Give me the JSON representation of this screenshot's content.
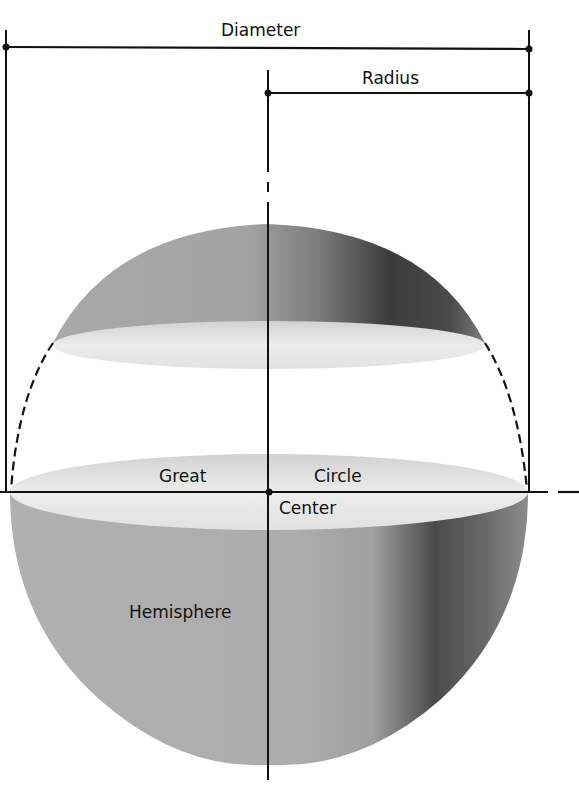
{
  "diagram": {
    "labels": {
      "diameter": "Diameter",
      "radius": "Radius",
      "great": "Great",
      "circle": "Circle",
      "center": "Center",
      "hemisphere": "Hemisphere"
    },
    "colors": {
      "background": "#ffffff",
      "line": "#111111",
      "sphere_light": "#b9b9b9",
      "sphere_mid": "#9c9c9c",
      "sphere_dark": "#3a3a3a",
      "section_face": "#e6e6e6"
    }
  }
}
